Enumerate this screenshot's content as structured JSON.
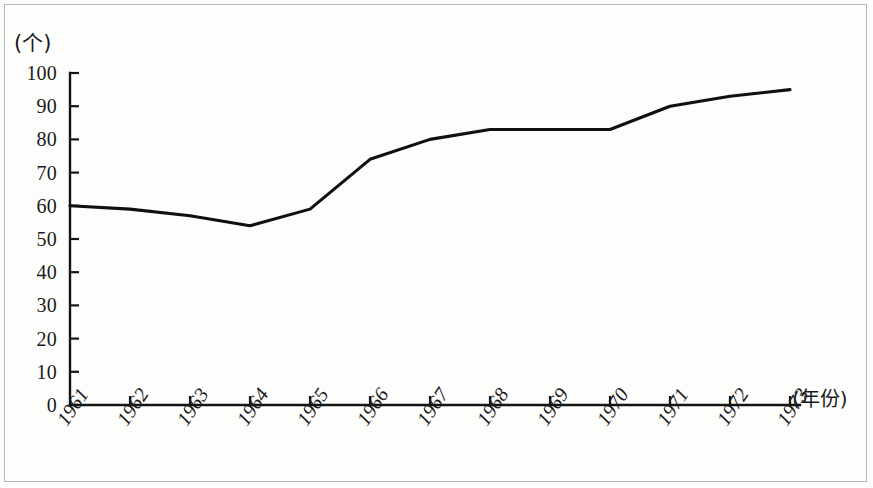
{
  "chart_data": {
    "type": "line",
    "title": "",
    "xlabel": "(年份)",
    "ylabel": "(个)",
    "categories": [
      "1961",
      "1962",
      "1963",
      "1964",
      "1965",
      "1966",
      "1967",
      "1968",
      "1969",
      "1970",
      "1971",
      "1972",
      "1973"
    ],
    "values": [
      60,
      59,
      57,
      54,
      59,
      74,
      80,
      83,
      83,
      83,
      90,
      93,
      95
    ],
    "series": [
      {
        "name": "",
        "values": [
          60,
          59,
          57,
          54,
          59,
          74,
          80,
          83,
          83,
          83,
          90,
          93,
          95
        ]
      }
    ],
    "ylim": [
      0,
      100
    ],
    "y_ticks": [
      "0",
      "10",
      "20",
      "30",
      "40",
      "50",
      "60",
      "70",
      "80",
      "90",
      "100"
    ],
    "y_tick_values": [
      0,
      10,
      20,
      30,
      40,
      50,
      60,
      70,
      80,
      90,
      100
    ],
    "xlim": [
      "1961",
      "1973"
    ],
    "grid": false,
    "legend": false,
    "legend_position": "none",
    "line_color": "#101010",
    "axis_color": "#141414",
    "background_color": "#fdfdfc"
  },
  "axis": {
    "y_unit_label": "(个)",
    "x_unit_label": "(年份)"
  }
}
